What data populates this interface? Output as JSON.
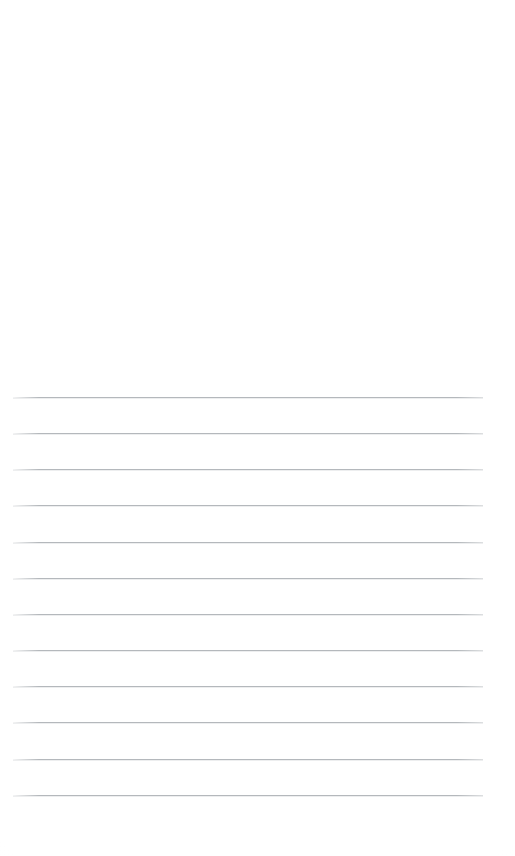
{
  "page": {
    "kind": "scanned-ruled-notepaper",
    "width": 515,
    "height": 856,
    "background_color": "#fefefe",
    "text_content": "",
    "handwriting_present": false
  },
  "blank_area": {
    "label": "",
    "top": 0,
    "height": 390
  },
  "ruling": {
    "line_color": "#b4b8bc",
    "line_thickness": 1,
    "line_count": 12,
    "first_line_y": 397,
    "line_spacing": 36.2,
    "left_margin_x": 13,
    "right_end_x": 483,
    "lines": [
      {
        "index": 1,
        "y": 397,
        "x_start": 13,
        "x_end": 483
      },
      {
        "index": 2,
        "y": 433,
        "x_start": 13,
        "x_end": 483
      },
      {
        "index": 3,
        "y": 469,
        "x_start": 13,
        "x_end": 483
      },
      {
        "index": 4,
        "y": 505,
        "x_start": 13,
        "x_end": 483
      },
      {
        "index": 5,
        "y": 542,
        "x_start": 13,
        "x_end": 483
      },
      {
        "index": 6,
        "y": 578,
        "x_start": 13,
        "x_end": 483
      },
      {
        "index": 7,
        "y": 614,
        "x_start": 13,
        "x_end": 483
      },
      {
        "index": 8,
        "y": 650,
        "x_start": 13,
        "x_end": 483
      },
      {
        "index": 9,
        "y": 686,
        "x_start": 13,
        "x_end": 483
      },
      {
        "index": 10,
        "y": 722,
        "x_start": 13,
        "x_end": 483
      },
      {
        "index": 11,
        "y": 759,
        "x_start": 13,
        "x_end": 483
      },
      {
        "index": 12,
        "y": 795,
        "x_start": 13,
        "x_end": 483
      }
    ]
  },
  "bottom_margin": {
    "label": "",
    "top": 796,
    "height": 60
  }
}
